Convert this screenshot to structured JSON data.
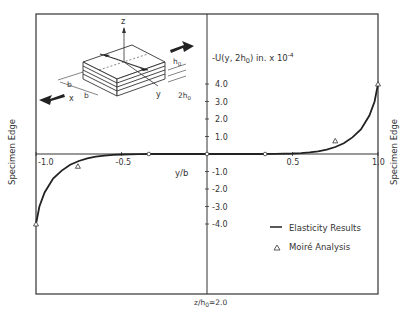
{
  "chart_data": {
    "type": "line",
    "title": "",
    "xlabel": "y/b",
    "ylabel": "-U(y, 2h0) in. x 10^-4",
    "ylabel_parts": {
      "main": "-U(y, 2h",
      "sub": "0",
      "tail": ") in.  x 10",
      "sup": "-4"
    },
    "xlim": [
      -1.0,
      1.0
    ],
    "ylim": [
      -4.0,
      4.0
    ],
    "x_ticks": [
      {
        "value": -1.0,
        "label": "-1.0"
      },
      {
        "value": -0.5,
        "label": "-0.5"
      },
      {
        "value": 0.5,
        "label": "0.5"
      },
      {
        "value": 1.0,
        "label": "1.0"
      }
    ],
    "y_ticks": [
      {
        "value": 4.0,
        "label": "4.0"
      },
      {
        "value": 3.0,
        "label": "3.0"
      },
      {
        "value": 2.0,
        "label": "2.0"
      },
      {
        "value": 1.0,
        "label": "1.0"
      },
      {
        "value": -1.0,
        "label": "-1.0"
      },
      {
        "value": -2.0,
        "label": "-2.0"
      },
      {
        "value": -3.0,
        "label": "-3.0"
      },
      {
        "value": -4.0,
        "label": "-4.0"
      }
    ],
    "grid": false,
    "series": [
      {
        "name": "Elasticity Results",
        "style": "line",
        "x": [
          -1.0,
          -0.98,
          -0.95,
          -0.9,
          -0.85,
          -0.8,
          -0.75,
          -0.7,
          -0.65,
          -0.6,
          -0.55,
          -0.5,
          -0.4,
          -0.3,
          -0.2,
          0.0,
          0.2,
          0.3,
          0.4,
          0.5,
          0.55,
          0.6,
          0.65,
          0.7,
          0.75,
          0.8,
          0.85,
          0.9,
          0.95,
          0.98,
          1.0
        ],
        "y": [
          -4.0,
          -3.0,
          -2.2,
          -1.4,
          -0.95,
          -0.62,
          -0.4,
          -0.25,
          -0.15,
          -0.09,
          -0.05,
          -0.03,
          -0.01,
          0.0,
          0.0,
          0.0,
          0.0,
          0.0,
          0.01,
          0.03,
          0.05,
          0.09,
          0.15,
          0.25,
          0.4,
          0.62,
          0.95,
          1.4,
          2.2,
          3.0,
          4.0
        ]
      },
      {
        "name": "Moiré Analysis",
        "style": "triangle",
        "x": [
          -1.0,
          -0.755,
          0.75,
          1.0
        ],
        "y": [
          -4.0,
          -0.7,
          0.75,
          4.0
        ]
      },
      {
        "name": "axis-markers",
        "style": "circle",
        "x": [
          -0.34,
          0.0,
          0.34
        ],
        "y": [
          0.0,
          0.0,
          0.0
        ]
      }
    ],
    "legend": {
      "position": "lower-right",
      "entries": [
        {
          "symbol": "line",
          "label": "Elasticity Results"
        },
        {
          "symbol": "triangle",
          "label": "Moiré Analysis"
        }
      ]
    },
    "annotations": {
      "left_edge": "Specimen Edge",
      "right_edge": "Specimen Edge",
      "condition": "z/h0=2.0",
      "condition_parts": {
        "main": "z/h",
        "sub": "0",
        "tail": "=2.0"
      }
    },
    "inset": {
      "axis_z": "z",
      "axis_x": "x",
      "axis_y": "y",
      "dim_b": "b",
      "dim_h0": "h0",
      "dim_2h0": "2h0"
    }
  }
}
